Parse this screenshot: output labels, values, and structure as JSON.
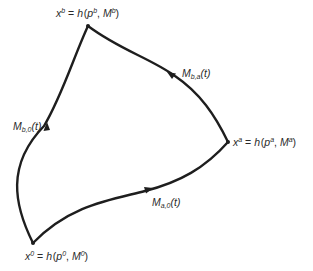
{
  "diagram": {
    "type": "curved triangle of paths between three states",
    "stroke_color": "#1e1e1e",
    "background": "#ffffff",
    "vertices": {
      "b": {
        "var": "x",
        "sup": "b",
        "eq": "=",
        "fn": "h",
        "p": "p",
        "p_sup": "b",
        "m": "M",
        "m_sup": "b",
        "text": "x^b = h(p^b, M^b)",
        "position": [
          88,
          26
        ]
      },
      "a": {
        "var": "x",
        "sup": "a",
        "eq": "=",
        "fn": "h",
        "p": "p",
        "p_sup": "a",
        "m": "M",
        "m_sup": "a",
        "text": "x^a = h(p^a, M^a)",
        "position": [
          228,
          142
        ]
      },
      "zero": {
        "var": "x",
        "sup": "0",
        "eq": "=",
        "fn": "h",
        "p": "p",
        "p_sup": "0",
        "m": "M",
        "m_sup": "0",
        "text": "x^0 = h(p^0, M^0)",
        "position": [
          33,
          243
        ]
      }
    },
    "paths": {
      "b0": {
        "name": "M",
        "sub": "b,0",
        "arg": "(t)",
        "text": "M_{b,0}(t)",
        "from": "zero",
        "to": "b"
      },
      "ba": {
        "name": "M",
        "sub": "b,a",
        "arg": "(t)",
        "text": "M_{b,a}(t)",
        "from": "a",
        "to": "b"
      },
      "a0": {
        "name": "M",
        "sub": "a,0",
        "arg": "(t)",
        "text": "M_{a,0}(t)",
        "from": "zero",
        "to": "a"
      }
    }
  }
}
